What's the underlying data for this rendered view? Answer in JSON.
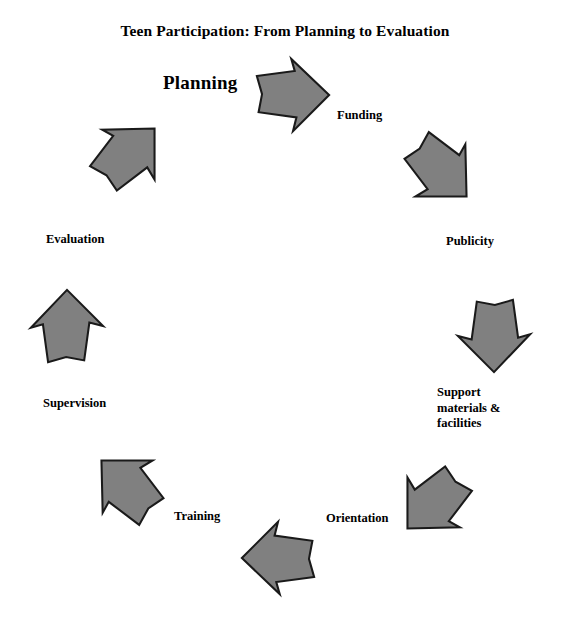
{
  "diagram": {
    "title": "Teen Participation: From Planning to Evaluation",
    "type": "cycle",
    "direction": "clockwise",
    "arrow_fill": "#808080",
    "arrow_stroke": "#1a1a1a",
    "background": "#ffffff",
    "text_color": "#000000",
    "steps": [
      {
        "id": "planning",
        "label": "Planning",
        "emphasis": "lead",
        "arrow_rotation_deg": 0,
        "arrow_points_to": "right",
        "position": "top"
      },
      {
        "id": "funding",
        "label": "Funding",
        "emphasis": "normal",
        "arrow_rotation_deg": 45,
        "arrow_points_to": "down-right",
        "position": "top-right"
      },
      {
        "id": "publicity",
        "label": "Publicity",
        "emphasis": "normal",
        "arrow_rotation_deg": 90,
        "arrow_points_to": "down",
        "position": "right"
      },
      {
        "id": "support-materials",
        "label": "Support\nmaterials &\nfacilities",
        "emphasis": "normal",
        "arrow_rotation_deg": 135,
        "arrow_points_to": "down-left",
        "position": "bottom-right"
      },
      {
        "id": "orientation",
        "label": "Orientation",
        "emphasis": "normal",
        "arrow_rotation_deg": 180,
        "arrow_points_to": "left",
        "position": "bottom"
      },
      {
        "id": "training",
        "label": "Training",
        "emphasis": "normal",
        "arrow_rotation_deg": 225,
        "arrow_points_to": "up-left",
        "position": "bottom-left"
      },
      {
        "id": "supervision",
        "label": "Supervision",
        "emphasis": "normal",
        "arrow_rotation_deg": 270,
        "arrow_points_to": "up",
        "position": "left"
      },
      {
        "id": "evaluation",
        "label": "Evaluation",
        "emphasis": "normal",
        "arrow_rotation_deg": 315,
        "arrow_points_to": "up-right",
        "position": "top-left"
      }
    ]
  }
}
